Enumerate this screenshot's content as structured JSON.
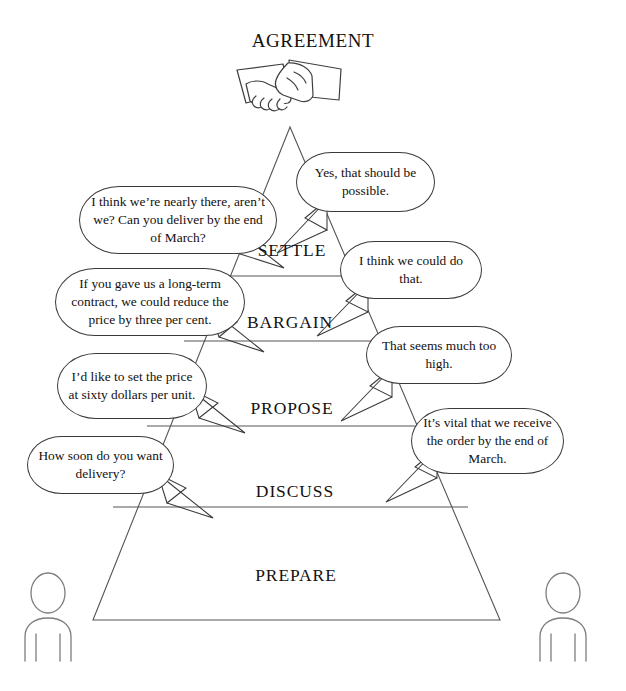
{
  "diagram": {
    "title": "AGREEMENT",
    "icon": "handshake-icon",
    "type": "negotiation-pyramid"
  },
  "stages": [
    {
      "id": "settle",
      "label": "SETTLE"
    },
    {
      "id": "bargain",
      "label": "BARGAIN"
    },
    {
      "id": "propose",
      "label": "PROPOSE"
    },
    {
      "id": "discuss",
      "label": "DISCUSS"
    },
    {
      "id": "prepare",
      "label": "PREPARE"
    }
  ],
  "bubbles": [
    {
      "id": "settle-right",
      "side": "right",
      "stage": "settle",
      "text": "Yes, that should be possible."
    },
    {
      "id": "settle-left",
      "side": "left",
      "stage": "settle",
      "text": "I think we’re nearly there, aren’t we? Can you deliver by the end of March?"
    },
    {
      "id": "bargain-right",
      "side": "right",
      "stage": "bargain",
      "text": "I think we could do that."
    },
    {
      "id": "bargain-left",
      "side": "left",
      "stage": "bargain",
      "text": "If you gave us a long-term contract, we could reduce the price by three per cent."
    },
    {
      "id": "propose-right",
      "side": "right",
      "stage": "propose",
      "text": "That seems much too high."
    },
    {
      "id": "propose-left",
      "side": "left",
      "stage": "propose",
      "text": "I’d like to set the price at sixty dollars per unit."
    },
    {
      "id": "discuss-right",
      "side": "right",
      "stage": "discuss",
      "text": "It’s vital that we receive the order by the end of March."
    },
    {
      "id": "discuss-left",
      "side": "left",
      "stage": "discuss",
      "text": "How soon do you want delivery?"
    }
  ],
  "figures": [
    {
      "id": "negotiator-left",
      "name": "person-figure-left"
    },
    {
      "id": "negotiator-right",
      "name": "person-figure-right"
    }
  ],
  "colors": {
    "stroke": "#3a3a3a",
    "pyramid_stroke": "#555555",
    "figure_stroke": "#7d7d7d",
    "text": "#15110f",
    "background": "#ffffff"
  }
}
